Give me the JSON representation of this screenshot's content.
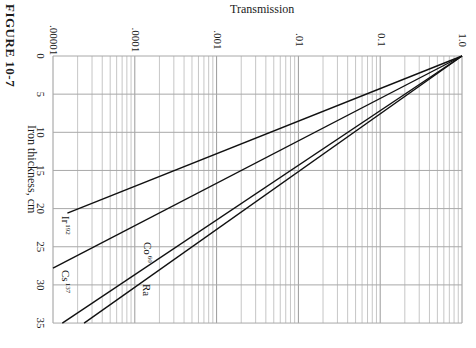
{
  "figure": {
    "label": "FIGURE 10-7"
  },
  "chart_data": {
    "type": "line",
    "title": "",
    "figure_label": "FIGURE 10-7",
    "orientation_note": "Rendered rotated 90°: transmission axis runs horizontally across the top, thickness axis runs vertically down the left",
    "xlabel": "Iron thickness, cm",
    "ylabel": "Transmission",
    "x_scale": "linear",
    "y_scale": "log",
    "xlim": [
      0,
      35
    ],
    "ylim": [
      1e-05,
      1.0
    ],
    "x_ticks": [
      0,
      5,
      10,
      15,
      20,
      25,
      30,
      35
    ],
    "x_tick_labels": [
      "0",
      "5",
      "10",
      "15",
      "20",
      "25",
      "30",
      "35"
    ],
    "y_ticks": [
      1e-05,
      0.0001,
      0.001,
      0.01,
      0.1,
      1.0
    ],
    "y_tick_labels": [
      ".00001",
      ".0001",
      ".001",
      ".01",
      "0.1",
      "1.0"
    ],
    "grid": true,
    "legend": "inline labels",
    "series": [
      {
        "name": "Ir 192",
        "label_main": "Ir",
        "label_sup": "192",
        "x": [
          0,
          20.6
        ],
        "y": [
          1.0,
          1.5e-05
        ]
      },
      {
        "name": "Cs 137",
        "label_main": "Cs",
        "label_sup": "137",
        "x": [
          0,
          27.8
        ],
        "y": [
          1.0,
          1e-05
        ]
      },
      {
        "name": "Co 60",
        "label_main": "Co",
        "label_sup": "60",
        "x": [
          0,
          35
        ],
        "y": [
          1.0,
          1.3e-05
        ]
      },
      {
        "name": "Ra",
        "label_main": "Ra",
        "label_sup": "",
        "x": [
          0,
          35
        ],
        "y": [
          1.0,
          2.4e-05
        ]
      }
    ]
  }
}
